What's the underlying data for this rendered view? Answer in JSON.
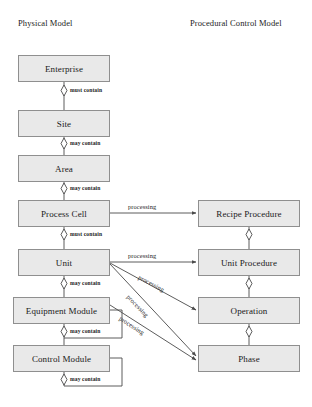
{
  "diagram": {
    "columns": [
      {
        "id": "physical",
        "header": "Physical Model"
      },
      {
        "id": "procedural",
        "header": "Procedural Control Model"
      }
    ],
    "physical_nodes": [
      {
        "id": "enterprise",
        "label": "Enterprise"
      },
      {
        "id": "site",
        "label": "Site"
      },
      {
        "id": "area",
        "label": "Area"
      },
      {
        "id": "process-cell",
        "label": "Process Cell"
      },
      {
        "id": "unit",
        "label": "Unit"
      },
      {
        "id": "equipment-module",
        "label": "Equipment Module"
      },
      {
        "id": "control-module",
        "label": "Control Module"
      }
    ],
    "procedural_nodes": [
      {
        "id": "recipe-procedure",
        "label": "Recipe Procedure"
      },
      {
        "id": "unit-procedure",
        "label": "Unit Procedure"
      },
      {
        "id": "operation",
        "label": "Operation"
      },
      {
        "id": "phase",
        "label": "Phase"
      }
    ],
    "aggregation_edges": [
      {
        "from": "enterprise",
        "to": "site",
        "label": "must contain"
      },
      {
        "from": "site",
        "to": "area",
        "label": "may contain"
      },
      {
        "from": "area",
        "to": "process-cell",
        "label": "may contain"
      },
      {
        "from": "process-cell",
        "to": "unit",
        "label": "must contain"
      },
      {
        "from": "unit",
        "to": "equipment-module",
        "label": "may contain"
      },
      {
        "from": "equipment-module",
        "to": "control-module",
        "label": "may contain"
      },
      {
        "from": "equipment-module",
        "to": "equipment-module",
        "label": "may contain"
      },
      {
        "from": "control-module",
        "to": "control-module",
        "label": "may contain"
      },
      {
        "from": "recipe-procedure",
        "to": "unit-procedure",
        "label": ""
      },
      {
        "from": "unit-procedure",
        "to": "operation",
        "label": ""
      },
      {
        "from": "operation",
        "to": "phase",
        "label": ""
      }
    ],
    "mapping_edges": [
      {
        "from": "process-cell",
        "to": "recipe-procedure",
        "label": "processing"
      },
      {
        "from": "unit",
        "to": "unit-procedure",
        "label": "processing"
      },
      {
        "from": "unit",
        "to": "operation",
        "label": "processing"
      },
      {
        "from": "unit",
        "to": "phase",
        "label": "processing"
      },
      {
        "from": "equipment-module",
        "to": "phase",
        "label": "processing"
      }
    ],
    "colors": {
      "node_fill": "#e9e9e9",
      "node_border": "#8f8f8f",
      "edge": "#4a4a4a",
      "text": "#1a1a1a",
      "background": "#ffffff"
    },
    "caption": ""
  }
}
